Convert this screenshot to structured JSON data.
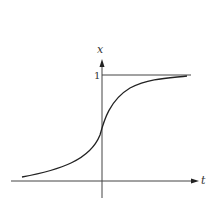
{
  "diagram": {
    "type": "step-function-vs-sigmoid",
    "axes": {
      "x_axis_label": "t",
      "y_axis_label": "x",
      "y_tick_label": "1"
    },
    "curves": [
      {
        "name": "step-function",
        "description": "Unit step: 0 for t<0, 1 for t>=0"
      },
      {
        "name": "sigmoid-curve",
        "description": "Smooth S-shaped curve approaching 0 and 1"
      }
    ],
    "colors": {
      "line": "#333333",
      "background": "#ffffff"
    }
  }
}
